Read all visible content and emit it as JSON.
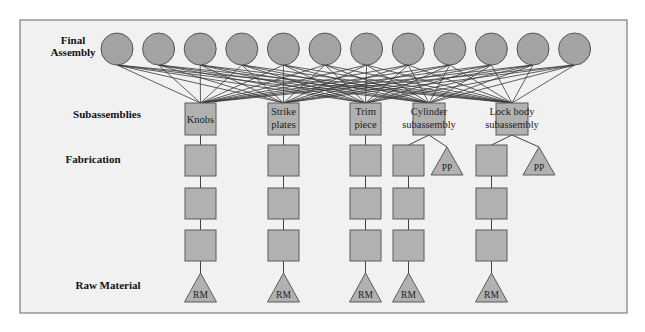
{
  "colors": {
    "frame_fill": "#f1f1f1",
    "frame_stroke": "#7d7d7d",
    "node_fill": "#b1b1b1",
    "circle_fill": "#a3a3a3"
  },
  "levels": [
    {
      "id": "final",
      "label_lines": [
        "Final",
        "Assembly"
      ],
      "x": 73,
      "y": 44
    },
    {
      "id": "sub",
      "label_lines": [
        "Subassemblies"
      ],
      "x": 107,
      "y": 118
    },
    {
      "id": "fab",
      "label_lines": [
        "Fabrication"
      ],
      "x": 93,
      "y": 163
    },
    {
      "id": "raw",
      "label_lines": [
        "Raw Material"
      ],
      "x": 108,
      "y": 289
    }
  ],
  "final_assembly": {
    "count": 12,
    "start_cx": 117,
    "spacing": 41.6,
    "cy": 49,
    "r": 16
  },
  "subassemblies": [
    {
      "name": "Knobs",
      "label_lines": [
        "Knobs"
      ],
      "x": 185,
      "y": 103,
      "w": 31,
      "h": 32,
      "fabrication_squares": [
        {
          "x": 185,
          "y": 145
        },
        {
          "x": 185,
          "y": 188
        },
        {
          "x": 185,
          "y": 230
        }
      ],
      "raw_material": {
        "label": "RM",
        "cx": 200.5,
        "top": 273,
        "base": 302,
        "half": 16
      },
      "purchased_part": null
    },
    {
      "name": "Strike plates",
      "label_lines": [
        "Strike",
        "plates"
      ],
      "x": 268,
      "y": 103,
      "w": 31,
      "h": 32,
      "fabrication_squares": [
        {
          "x": 268,
          "y": 145
        },
        {
          "x": 268,
          "y": 188
        },
        {
          "x": 268,
          "y": 230
        }
      ],
      "raw_material": {
        "label": "RM",
        "cx": 283.5,
        "top": 273,
        "base": 302,
        "half": 16
      },
      "purchased_part": null
    },
    {
      "name": "Trim piece",
      "label_lines": [
        "Trim",
        "piece"
      ],
      "x": 350,
      "y": 103,
      "w": 31,
      "h": 32,
      "fabrication_squares": [
        {
          "x": 350,
          "y": 145
        },
        {
          "x": 350,
          "y": 188
        },
        {
          "x": 350,
          "y": 230
        }
      ],
      "raw_material": {
        "label": "RM",
        "cx": 365.5,
        "top": 273,
        "base": 302,
        "half": 16
      },
      "purchased_part": null
    },
    {
      "name": "Cylinder subassembly",
      "label_lines": [
        "Cylinder",
        "subassembly"
      ],
      "x": 413,
      "y": 103,
      "w": 32,
      "h": 32,
      "fabrication_squares": [
        {
          "x": 393,
          "y": 145
        },
        {
          "x": 393,
          "y": 188
        },
        {
          "x": 393,
          "y": 230
        }
      ],
      "raw_material": {
        "label": "RM",
        "cx": 408.5,
        "top": 273,
        "base": 302,
        "half": 16
      },
      "purchased_part": {
        "label": "PP",
        "cx": 447,
        "top": 147,
        "base": 175,
        "half": 16
      }
    },
    {
      "name": "Lock body subassembly",
      "label_lines": [
        "Lock body",
        "subassembly"
      ],
      "x": 496,
      "y": 103,
      "w": 32,
      "h": 32,
      "fabrication_squares": [
        {
          "x": 476,
          "y": 145
        },
        {
          "x": 476,
          "y": 188
        },
        {
          "x": 476,
          "y": 230
        }
      ],
      "raw_material": {
        "label": "RM",
        "cx": 491.5,
        "top": 273,
        "base": 302,
        "half": 16
      },
      "purchased_part": {
        "label": "PP",
        "cx": 539,
        "top": 147,
        "base": 175,
        "half": 16
      }
    }
  ],
  "square_size": 31
}
